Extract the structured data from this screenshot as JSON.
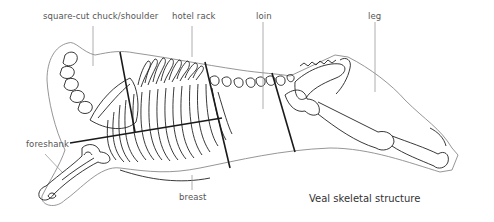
{
  "diagram": {
    "title": "Veal skeletal structure",
    "labels": [
      {
        "id": "chuck",
        "text": "square-cut chuck/shoulder"
      },
      {
        "id": "hotel-rack",
        "text": "hotel rack"
      },
      {
        "id": "loin",
        "text": "loin"
      },
      {
        "id": "leg",
        "text": "leg"
      },
      {
        "id": "foreshank",
        "text": "foreshank"
      },
      {
        "id": "breast",
        "text": "breast"
      }
    ],
    "colors": {
      "outline": "#888888",
      "bone": "#222222",
      "cut_line": "#1a1a1a",
      "leader": "#999999",
      "label_text": "#555555"
    }
  }
}
